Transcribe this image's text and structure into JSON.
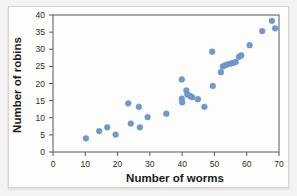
{
  "figure": {
    "name": "scatterplot-worms-robins",
    "background_color": "#f4f3f1",
    "panel_color": "#fdfdfc",
    "point_color": "#6f99cf",
    "axis_color": "#55595c"
  },
  "chart_data": {
    "type": "scatter",
    "title": "",
    "xlabel": "Number of worms",
    "ylabel": "Number of robins",
    "xlim": [
      0,
      70
    ],
    "ylim": [
      0,
      40
    ],
    "xticks": [
      0,
      10,
      20,
      30,
      40,
      50,
      60,
      70
    ],
    "yticks": [
      0,
      5,
      10,
      15,
      20,
      25,
      30,
      35,
      40
    ],
    "grid": false,
    "legend": null,
    "series": [
      {
        "name": "worms vs robins",
        "color": "#6f99cf",
        "points": [
          [
            10.2,
            4.0
          ],
          [
            14.3,
            6.1
          ],
          [
            16.8,
            7.2
          ],
          [
            19.4,
            5.1
          ],
          [
            23.3,
            14.2
          ],
          [
            24.1,
            8.3
          ],
          [
            26.6,
            13.2
          ],
          [
            26.9,
            7.2
          ],
          [
            29.3,
            10.2
          ],
          [
            35.1,
            11.2
          ],
          [
            39.9,
            21.2
          ],
          [
            39.9,
            15.6
          ],
          [
            40.0,
            14.5
          ],
          [
            41.3,
            18.0
          ],
          [
            41.6,
            16.8
          ],
          [
            42.4,
            16.4
          ],
          [
            43.1,
            16.0
          ],
          [
            44.9,
            15.4
          ],
          [
            46.9,
            13.2
          ],
          [
            49.3,
            29.3
          ],
          [
            49.5,
            19.3
          ],
          [
            52.0,
            23.3
          ],
          [
            52.6,
            25.0
          ],
          [
            53.3,
            25.3
          ],
          [
            54.1,
            25.6
          ],
          [
            55.0,
            25.8
          ],
          [
            55.8,
            26.0
          ],
          [
            56.6,
            26.3
          ],
          [
            57.6,
            27.8
          ],
          [
            58.3,
            28.2
          ],
          [
            60.9,
            31.2
          ],
          [
            64.8,
            35.3
          ],
          [
            67.8,
            38.3
          ],
          [
            68.8,
            36.1
          ]
        ]
      }
    ]
  }
}
